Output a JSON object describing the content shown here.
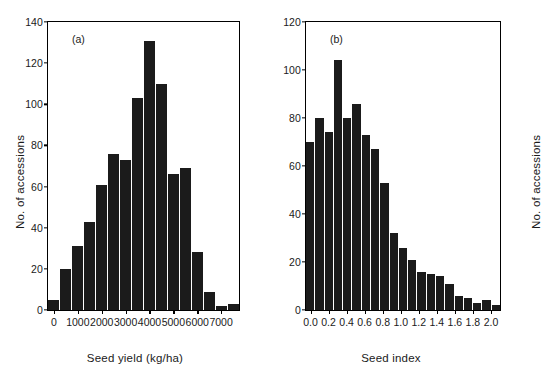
{
  "figure": {
    "background": "#ffffff",
    "bar_color": "#1b1b1b",
    "axis_color": "#000000"
  },
  "panels": [
    {
      "letter": "(a)",
      "xlabel": "Seed yield (kg/ha)",
      "ylabel": "No. of accessions",
      "yticks": [
        "0",
        "20",
        "40",
        "60",
        "80",
        "100",
        "120",
        "140"
      ],
      "xticks": [
        "0",
        "1000",
        "2000",
        "3000",
        "4000",
        "5000",
        "6000",
        "7000"
      ]
    },
    {
      "letter": "(b)",
      "xlabel": "Seed index",
      "ylabel": "No. of accessions",
      "yticks": [
        "0",
        "20",
        "40",
        "60",
        "80",
        "100",
        "120"
      ],
      "xticks": [
        "0.0",
        "0.2",
        "0.4",
        "0.6",
        "0.8",
        "1.0",
        "1.2",
        "1.4",
        "1.6",
        "1.8",
        "2.0"
      ]
    }
  ],
  "chart_data": [
    {
      "type": "bar",
      "title": "(a)",
      "xlabel": "Seed yield (kg/ha)",
      "ylabel": "No. of accessions",
      "bin_width": 500,
      "bin_starts": [
        0,
        500,
        1000,
        1500,
        2000,
        2500,
        3000,
        3500,
        4000,
        4500,
        5000,
        5500,
        6000,
        6500,
        7000,
        7500
      ],
      "categories": [
        "0-500",
        "500-1000",
        "1000-1500",
        "1500-2000",
        "2000-2500",
        "2500-3000",
        "3000-3500",
        "3500-4000",
        "4000-4500",
        "4500-5000",
        "5000-5500",
        "5500-6000",
        "6000-6500",
        "6500-7000",
        "7000-7500",
        "7500-8000"
      ],
      "values": [
        5,
        20,
        31,
        43,
        61,
        76,
        73,
        103,
        131,
        110,
        66,
        69,
        28,
        9,
        2,
        3
      ],
      "ylim": [
        0,
        140
      ],
      "xlim": [
        -250,
        7750
      ],
      "ytick_values": [
        0,
        20,
        40,
        60,
        80,
        100,
        120,
        140
      ],
      "xtick_values": [
        0,
        1000,
        2000,
        3000,
        4000,
        5000,
        6000,
        7000
      ],
      "grid": false,
      "legend": "none"
    },
    {
      "type": "bar",
      "title": "(b)",
      "xlabel": "Seed index",
      "ylabel": "No. of accessions",
      "bin_width": 0.1,
      "bin_starts": [
        0.0,
        0.1,
        0.2,
        0.3,
        0.4,
        0.5,
        0.6,
        0.7,
        0.8,
        0.9,
        1.0,
        1.1,
        1.2,
        1.3,
        1.4,
        1.5,
        1.6,
        1.7,
        1.8,
        1.9,
        2.0
      ],
      "categories": [
        "0.0-0.1",
        "0.1-0.2",
        "0.2-0.3",
        "0.3-0.4",
        "0.4-0.5",
        "0.5-0.6",
        "0.6-0.7",
        "0.7-0.8",
        "0.8-0.9",
        "0.9-1.0",
        "1.0-1.1",
        "1.1-1.2",
        "1.2-1.3",
        "1.3-1.4",
        "1.4-1.5",
        "1.5-1.6",
        "1.6-1.7",
        "1.7-1.8",
        "1.8-1.9",
        "1.9-2.0",
        "2.0-2.1"
      ],
      "values": [
        70,
        80,
        74,
        104,
        80,
        86,
        73,
        67,
        53,
        32,
        26,
        21,
        16,
        15,
        14,
        11,
        6,
        5,
        3,
        4,
        2
      ],
      "ylim": [
        0,
        120
      ],
      "xlim": [
        -0.05,
        2.1
      ],
      "ytick_values": [
        0,
        20,
        40,
        60,
        80,
        100,
        120
      ],
      "xtick_values": [
        0.0,
        0.2,
        0.4,
        0.6,
        0.8,
        1.0,
        1.2,
        1.4,
        1.6,
        1.8,
        2.0
      ],
      "grid": false,
      "legend": "none"
    }
  ]
}
